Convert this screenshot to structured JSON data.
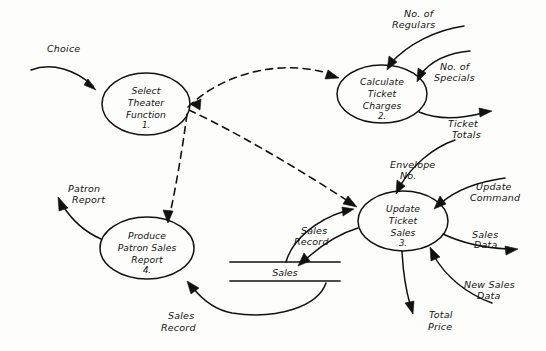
{
  "diagram": {
    "type": "data-flow-diagram",
    "style": "hand-drawn",
    "background_color": "#fdfdfc",
    "ink_color": "#111111"
  },
  "processes": [
    {
      "id": "p1",
      "line1": "Select",
      "line2": "Theater",
      "line3": "Function",
      "number": "1.",
      "cx": 146,
      "cy": 104,
      "rx": 44,
      "ry": 31
    },
    {
      "id": "p2",
      "line1": "Calculate",
      "line2": "Ticket",
      "line3": "Charges",
      "number": "2.",
      "cx": 382,
      "cy": 94,
      "rx": 45,
      "ry": 29
    },
    {
      "id": "p3",
      "line1": "Update",
      "line2": "Ticket",
      "line3": "Sales",
      "number": "3.",
      "cx": 403,
      "cy": 221,
      "rx": 45,
      "ry": 30
    },
    {
      "id": "p4",
      "line1": "Produce",
      "line2": "Patron Sales",
      "line3": "Report",
      "number": "4.",
      "cx": 147,
      "cy": 248,
      "rx": 47,
      "ry": 31
    }
  ],
  "data_stores": [
    {
      "id": "ds1",
      "label": "Sales",
      "x1": 230,
      "x2": 340,
      "y_top": 262,
      "y_bottom": 281,
      "label_x": 285,
      "label_y": 276
    }
  ],
  "flow_labels": [
    {
      "id": "f_choice",
      "text": "Choice",
      "x": 47,
      "y": 60,
      "lines": [
        "Choice"
      ]
    },
    {
      "id": "f_no_regulars",
      "text": "No. of Regulars",
      "x": 394,
      "y": 17,
      "lines": [
        "No. of",
        "Regulars"
      ]
    },
    {
      "id": "f_no_specials",
      "text": "No. of Specials",
      "x": 435,
      "y": 67,
      "lines": [
        "No. of",
        "Specials"
      ]
    },
    {
      "id": "f_ticket_totals",
      "text": "Ticket Totals",
      "x": 447,
      "y": 124,
      "lines": [
        "Ticket",
        "Totals"
      ]
    },
    {
      "id": "f_envelope_no",
      "text": "Envelope No.",
      "x": 392,
      "y": 166,
      "lines": [
        "Envelope",
        "No."
      ]
    },
    {
      "id": "f_update_command",
      "text": "Update Command",
      "x": 474,
      "y": 190,
      "lines": [
        "Update",
        "Command"
      ]
    },
    {
      "id": "f_sales_data",
      "text": "Sales Data",
      "x": 470,
      "y": 234,
      "lines": [
        "Sales",
        "Data"
      ]
    },
    {
      "id": "f_new_sales_data",
      "text": "New Sales Data",
      "x": 464,
      "y": 284,
      "lines": [
        "New Sales",
        "Data"
      ]
    },
    {
      "id": "f_total_price",
      "text": "Total Price",
      "x": 431,
      "y": 317,
      "lines": [
        "Total",
        "Price"
      ]
    },
    {
      "id": "f_sales_record_1",
      "text": "Sales Record",
      "x": 296,
      "y": 231,
      "lines": [
        "Sales",
        "Record"
      ]
    },
    {
      "id": "f_sales_record_2",
      "text": "Sales Record",
      "x": 163,
      "y": 314,
      "lines": [
        "Sales",
        "Record"
      ]
    },
    {
      "id": "f_patron_report",
      "text": "Patron Report",
      "x": 68,
      "y": 194,
      "lines": [
        "Patron",
        "Report"
      ]
    }
  ],
  "flows": [
    {
      "id": "flow-choice-to-select",
      "from": "external",
      "to": "p1",
      "label": "Choice",
      "kind": "data"
    },
    {
      "id": "flow-regulars-to-calculate",
      "from": "external",
      "to": "p2",
      "label": "No. of Regulars",
      "kind": "data"
    },
    {
      "id": "flow-specials-to-calculate",
      "from": "external",
      "to": "p2",
      "label": "No. of Specials",
      "kind": "data"
    },
    {
      "id": "flow-calculate-to-ticket-totals",
      "from": "p2",
      "to": "external",
      "label": "Ticket Totals",
      "kind": "data"
    },
    {
      "id": "flow-envelope-to-update",
      "from": "external",
      "to": "p3",
      "label": "Envelope No.",
      "kind": "data"
    },
    {
      "id": "flow-update-command-to-update",
      "from": "external",
      "to": "p3",
      "label": "Update Command",
      "kind": "data"
    },
    {
      "id": "flow-update-to-sales-data",
      "from": "p3",
      "to": "external",
      "label": "Sales Data",
      "kind": "data"
    },
    {
      "id": "flow-new-sales-data-to-update",
      "from": "external",
      "to": "p3",
      "label": "New Sales Data",
      "kind": "data"
    },
    {
      "id": "flow-update-to-total-price",
      "from": "p3",
      "to": "external",
      "label": "Total Price",
      "kind": "data"
    },
    {
      "id": "flow-update-to-sales-store",
      "from": "p3",
      "to": "ds1",
      "label": "Sales Record",
      "kind": "data"
    },
    {
      "id": "flow-sales-store-to-update",
      "from": "ds1",
      "to": "p3",
      "label": "Sales Record",
      "kind": "data"
    },
    {
      "id": "flow-sales-store-to-produce",
      "from": "ds1",
      "to": "p4",
      "label": "Sales Record",
      "kind": "data"
    },
    {
      "id": "flow-produce-to-patron-report",
      "from": "p4",
      "to": "external",
      "label": "Patron Report",
      "kind": "data"
    },
    {
      "id": "control-select-to-calculate",
      "from": "p1",
      "to": "p2",
      "label": "",
      "kind": "control"
    },
    {
      "id": "control-select-to-update",
      "from": "p1",
      "to": "p3",
      "label": "",
      "kind": "control"
    },
    {
      "id": "control-select-to-produce",
      "from": "p1",
      "to": "p4",
      "label": "",
      "kind": "control"
    }
  ]
}
